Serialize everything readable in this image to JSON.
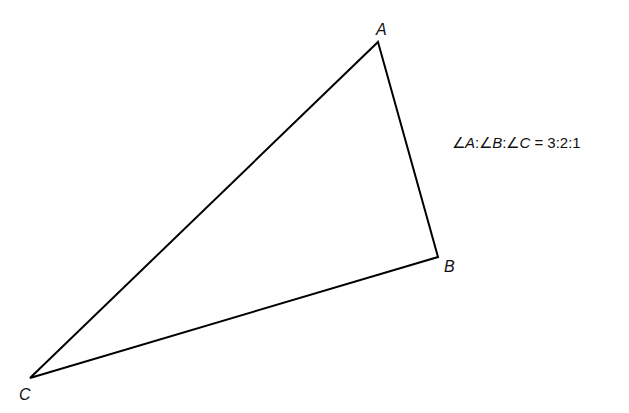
{
  "diagram": {
    "type": "triangle",
    "stroke_color": "#000000",
    "background": "#ffffff",
    "vertices": [
      {
        "name": "A",
        "x": 378,
        "y": 42
      },
      {
        "name": "B",
        "x": 438,
        "y": 257
      },
      {
        "name": "C",
        "x": 30,
        "y": 378
      }
    ],
    "labels": {
      "A": "A",
      "B": "B",
      "C": "C"
    },
    "annotation": {
      "angle_symbol": "∠",
      "parts": [
        "A",
        "B",
        "C"
      ],
      "separator": ":",
      "equals": " = ",
      "ratio": "3:2:1",
      "full_text": "∠A:∠B:∠C = 3:2:1"
    }
  }
}
